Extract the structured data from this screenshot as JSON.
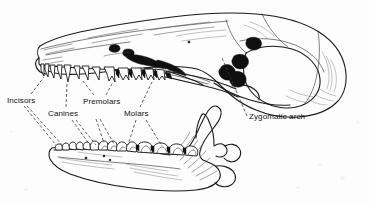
{
  "figure": {
    "type": "anatomical-illustration",
    "background_color": "#fdfdfd",
    "line_color": "#1a1a1a",
    "label_color": "#111111",
    "width": 369,
    "height": 205
  },
  "labels": [
    {
      "id": "incisors",
      "text": "Incisors",
      "x": 7,
      "y": 96
    },
    {
      "id": "canines",
      "text": "Canines",
      "x": 48,
      "y": 109
    },
    {
      "id": "premolars",
      "text": "Premolars",
      "x": 83,
      "y": 97
    },
    {
      "id": "molars",
      "text": "Molars",
      "x": 124,
      "y": 109
    },
    {
      "id": "zygomatic",
      "text": "Zygomatic arch",
      "x": 249,
      "y": 112
    }
  ],
  "leaders": {
    "style": "dashed",
    "dash_pattern": "3,2",
    "color": "#333333",
    "incisors_upper": "M 31,95 L 42,76",
    "incisors_lower": "M 28,106 L 53,143",
    "incisors_lower2": "M 30,106 L 60,145",
    "canines_upper": "M 68,108 L 60,78",
    "canines_lower": "M 70,120 L 72,146",
    "canines_lower2": "M 74,120 L 79,146",
    "premolars_upper": "M 96,96 L 86,76",
    "premolars_upper2": "M 106,96 L 116,77",
    "premolars_lower": "M 94,120 L 84,148",
    "premolars_lower2": "M 100,120 L 104,148",
    "molars_upper": "M 142,108 L 160,82",
    "molars_lower": "M 140,120 L 122,148",
    "molars_lower2": "M 146,120 L 150,148",
    "zygomatic": "M 247,116 L 222,57"
  },
  "structures": {
    "cranium": "braincase",
    "rostrum": "snout / maxilla",
    "zygomatic_arch": "cheek bone arch",
    "mandible": "lower jaw",
    "coronoid_process": "ascending ramus",
    "condylar_process": "jaw joint",
    "angular_process": "posterior jaw angle"
  },
  "dentition": {
    "upper_incisors": 4,
    "upper_canine": 1,
    "upper_premolars": 4,
    "upper_molars": 4,
    "lower_incisors": 5,
    "lower_canine": 1,
    "lower_premolars": 4,
    "lower_molars": 4
  }
}
